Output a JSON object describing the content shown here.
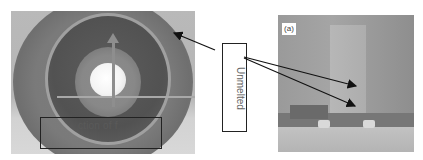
{
  "figure": {
    "left_photo": {
      "subject": "circular part with inner ring and central hole",
      "box_label": "ction of f"
    },
    "right_photo": {
      "subject": "vertical wall on base plate",
      "panel_tag": "(a)"
    },
    "callout": {
      "label": "Unmelted",
      "arrow_count": 3
    },
    "colors": {
      "background": "#ffffff",
      "arrow": "#111111",
      "box_border": "#222222",
      "label_text": "#666666"
    }
  }
}
